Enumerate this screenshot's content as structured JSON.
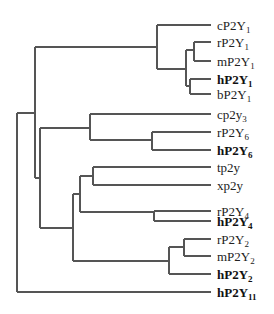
{
  "diagram": {
    "type": "phylogenetic-tree",
    "line_color": "#555555",
    "text_color": "#222222",
    "leaves": [
      {
        "prefix": "cP2Y",
        "sub": "1",
        "bold": false,
        "y": 25
      },
      {
        "prefix": "rP2Y",
        "sub": "1",
        "bold": false,
        "y": 42
      },
      {
        "prefix": "mP2Y",
        "sub": "1",
        "bold": false,
        "y": 61
      },
      {
        "prefix": "hP2Y",
        "sub": "1",
        "bold": true,
        "y": 79
      },
      {
        "prefix": "bP2Y",
        "sub": "1",
        "bold": false,
        "y": 94
      },
      {
        "prefix": "cp2y",
        "sub": "3",
        "bold": false,
        "y": 114
      },
      {
        "prefix": "rP2Y",
        "sub": "6",
        "bold": false,
        "y": 132
      },
      {
        "prefix": "hP2Y",
        "sub": "6",
        "bold": true,
        "y": 150
      },
      {
        "prefix": "tp2y",
        "sub": "",
        "bold": false,
        "y": 167
      },
      {
        "prefix": "xp2y",
        "sub": "",
        "bold": false,
        "y": 185
      },
      {
        "prefix": "rP2Y",
        "sub": "4",
        "bold": false,
        "y": 211
      },
      {
        "prefix": "hP2Y",
        "sub": "4",
        "bold": true,
        "y": 221
      },
      {
        "prefix": "rP2Y",
        "sub": "2",
        "bold": false,
        "y": 239
      },
      {
        "prefix": "mP2Y",
        "sub": "2",
        "bold": false,
        "y": 256
      },
      {
        "prefix": "hP2Y",
        "sub": "2",
        "bold": true,
        "y": 274
      },
      {
        "prefix": "hP2Y",
        "sub": "11",
        "bold": true,
        "y": 292
      }
    ],
    "label_x": 217,
    "leaf_end_x": 211,
    "segments": [
      [
        17,
        113,
        17,
        292
      ],
      [
        17,
        113,
        35,
        113
      ],
      [
        17,
        292,
        211,
        292
      ],
      [
        35,
        47,
        35,
        178
      ],
      [
        35,
        47,
        157,
        47
      ],
      [
        157,
        25,
        157,
        69
      ],
      [
        157,
        25,
        211,
        25
      ],
      [
        157,
        69,
        186,
        69
      ],
      [
        186,
        50,
        186,
        86
      ],
      [
        186,
        50,
        194,
        50
      ],
      [
        194,
        42,
        194,
        61
      ],
      [
        194,
        42,
        211,
        42
      ],
      [
        194,
        61,
        211,
        61
      ],
      [
        186,
        86,
        190,
        86
      ],
      [
        190,
        79,
        190,
        94
      ],
      [
        190,
        79,
        211,
        79
      ],
      [
        190,
        94,
        211,
        94
      ],
      [
        35,
        178,
        40,
        178
      ],
      [
        40,
        128,
        40,
        228
      ],
      [
        40,
        128,
        90,
        128
      ],
      [
        90,
        114,
        90,
        140
      ],
      [
        90,
        114,
        211,
        114
      ],
      [
        90,
        140,
        152,
        140
      ],
      [
        152,
        132,
        152,
        150
      ],
      [
        152,
        132,
        211,
        132
      ],
      [
        152,
        150,
        211,
        150
      ],
      [
        40,
        228,
        73,
        228
      ],
      [
        73,
        194,
        73,
        261
      ],
      [
        73,
        194,
        80,
        194
      ],
      [
        80,
        176,
        80,
        212
      ],
      [
        80,
        176,
        93,
        176
      ],
      [
        93,
        167,
        93,
        185
      ],
      [
        93,
        167,
        211,
        167
      ],
      [
        93,
        185,
        211,
        185
      ],
      [
        80,
        212,
        154,
        212
      ],
      [
        154,
        211,
        154,
        221
      ],
      [
        154,
        211,
        211,
        211
      ],
      [
        154,
        221,
        211,
        221
      ],
      [
        73,
        261,
        169,
        261
      ],
      [
        169,
        247,
        169,
        274
      ],
      [
        169,
        247,
        184,
        247
      ],
      [
        184,
        239,
        184,
        256
      ],
      [
        184,
        239,
        211,
        239
      ],
      [
        184,
        256,
        211,
        256
      ],
      [
        169,
        274,
        211,
        274
      ]
    ]
  }
}
